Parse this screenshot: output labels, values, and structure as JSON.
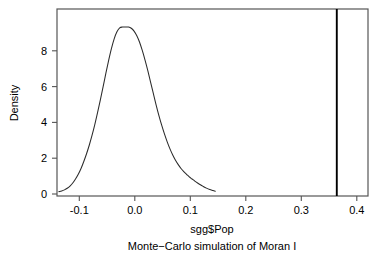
{
  "chart_data": {
    "type": "line",
    "title": "",
    "subtitle": "Monte−Carlo simulation of Moran I",
    "xlabel": "sgg$Pop",
    "ylabel": "Density",
    "xlim": [
      -0.1425,
      0.4205
    ],
    "ylim": [
      -0.19,
      10.48
    ],
    "grid": false,
    "legend": null,
    "xticks": [
      -0.1,
      0.0,
      0.1,
      0.2,
      0.3,
      0.4
    ],
    "xtick_labels": [
      "-0.1",
      "0.0",
      "0.1",
      "0.2",
      "0.3",
      "0.4"
    ],
    "yticks": [
      0,
      2,
      4,
      6,
      8
    ],
    "ytick_labels": [
      "0",
      "2",
      "4",
      "6",
      "8"
    ],
    "line_color": "#2b2b2b",
    "frame_color": "#555555",
    "series": [
      {
        "name": "Monte-Carlo density",
        "x": [
          -0.139,
          -0.134,
          -0.129,
          -0.124,
          -0.119,
          -0.114,
          -0.109,
          -0.104,
          -0.099,
          -0.094,
          -0.089,
          -0.084,
          -0.079,
          -0.074,
          -0.069,
          -0.064,
          -0.059,
          -0.054,
          -0.049,
          -0.044,
          -0.039,
          -0.034,
          -0.029,
          -0.024,
          -0.019,
          -0.013,
          -0.008,
          -0.003,
          0.002,
          0.007,
          0.012,
          0.017,
          0.022,
          0.027,
          0.032,
          0.037,
          0.042,
          0.047,
          0.052,
          0.057,
          0.062,
          0.067,
          0.072,
          0.077,
          0.082,
          0.087,
          0.092,
          0.097,
          0.102,
          0.107,
          0.112,
          0.117,
          0.122,
          0.128,
          0.134,
          0.14,
          0.144
        ],
        "y": [
          0.06,
          0.1,
          0.16,
          0.25,
          0.38,
          0.55,
          0.78,
          1.05,
          1.38,
          1.78,
          2.22,
          2.72,
          3.28,
          3.9,
          4.58,
          5.3,
          6.05,
          6.82,
          7.55,
          8.22,
          8.78,
          9.18,
          9.4,
          9.45,
          9.45,
          9.45,
          9.38,
          9.22,
          8.95,
          8.58,
          8.1,
          7.55,
          6.95,
          6.3,
          5.65,
          5.0,
          4.4,
          3.85,
          3.35,
          2.9,
          2.5,
          2.15,
          1.85,
          1.6,
          1.38,
          1.2,
          1.05,
          0.9,
          0.78,
          0.66,
          0.55,
          0.45,
          0.36,
          0.26,
          0.18,
          0.12,
          0.08
        ]
      }
    ],
    "annotations": [
      {
        "name": "observed-statistic-line",
        "type": "vline",
        "x": 0.364,
        "color": "#000000",
        "label": ""
      }
    ]
  }
}
